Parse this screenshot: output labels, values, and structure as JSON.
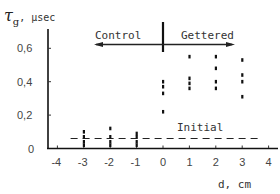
{
  "chart_data": {
    "type": "scatter",
    "title": "",
    "ylabel": "τg, μsec",
    "ylabel_parts": {
      "symbol": "τ",
      "subscript": "g",
      "unit": ", μsec"
    },
    "xlabel": "d, cm",
    "xlim": [
      -4,
      4
    ],
    "ylim": [
      0,
      0.7
    ],
    "grid": false,
    "x_ticks": [
      -4,
      -3,
      -2,
      -1,
      0,
      1,
      2,
      3,
      4
    ],
    "x_tick_labels": [
      "-4",
      "-3",
      "-2",
      "-1",
      "0",
      "1",
      "2",
      "3",
      "4"
    ],
    "y_ticks": [
      0,
      0.2,
      0.4,
      0.6
    ],
    "y_tick_labels": [
      "0",
      "0,2",
      "0,4",
      "0,6"
    ],
    "annotations": [
      {
        "text": "Control",
        "type": "arrow-left",
        "region": "d < 0"
      },
      {
        "text": "Gettered",
        "type": "arrow-right",
        "region": "d > 0"
      },
      {
        "text": "Initial",
        "type": "dashed-line",
        "y": 0.06
      }
    ],
    "divider_x": 0,
    "series": [
      {
        "name": "Control",
        "points": [
          {
            "x": -3,
            "y": 0.1
          },
          {
            "x": -3,
            "y": 0.07
          },
          {
            "x": -3,
            "y": 0.04
          },
          {
            "x": -3,
            "y": 0.02
          },
          {
            "x": -2,
            "y": 0.12
          },
          {
            "x": -2,
            "y": 0.07
          },
          {
            "x": -2,
            "y": 0.04
          },
          {
            "x": -2,
            "y": 0.02
          },
          {
            "x": -1,
            "y": 0.09
          },
          {
            "x": -1,
            "y": 0.07
          },
          {
            "x": -1,
            "y": 0.04
          },
          {
            "x": -1,
            "y": 0.02
          }
        ]
      },
      {
        "name": "Gettered",
        "points": [
          {
            "x": 0,
            "y": 0.4
          },
          {
            "x": 0,
            "y": 0.37
          },
          {
            "x": 0,
            "y": 0.33
          },
          {
            "x": 0,
            "y": 0.22
          },
          {
            "x": 1,
            "y": 0.55
          },
          {
            "x": 1,
            "y": 0.42
          },
          {
            "x": 1,
            "y": 0.39
          },
          {
            "x": 1,
            "y": 0.36
          },
          {
            "x": 2,
            "y": 0.55
          },
          {
            "x": 2,
            "y": 0.48
          },
          {
            "x": 2,
            "y": 0.4
          },
          {
            "x": 2,
            "y": 0.36
          },
          {
            "x": 3,
            "y": 0.53
          },
          {
            "x": 3,
            "y": 0.44
          },
          {
            "x": 3,
            "y": 0.4
          },
          {
            "x": 3,
            "y": 0.31
          }
        ]
      },
      {
        "name": "Initial",
        "type": "dashed-line",
        "x": [
          -3.5,
          3.6
        ],
        "values": [
          0.06,
          0.06
        ]
      }
    ]
  },
  "labels": {
    "y_symbol": "τ",
    "y_sub": "g",
    "y_unit": ", μsec",
    "x_axis": "d, cm",
    "control": "Control",
    "gettered": "Gettered",
    "initial": "Initial"
  }
}
